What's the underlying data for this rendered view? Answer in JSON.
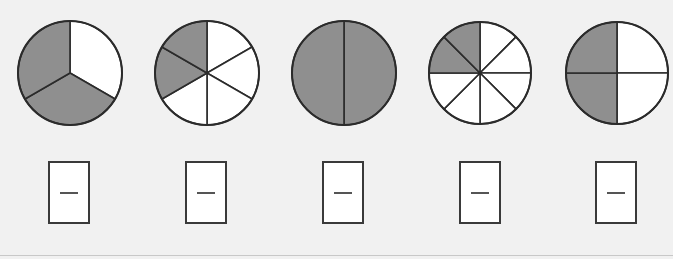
{
  "colors": {
    "shaded": "#8f8f8f",
    "unshaded": "#ffffff",
    "outline": "#2b2b2b",
    "background": "#f1f1f1"
  },
  "figures": [
    {
      "id": "circle-1",
      "parts": 3,
      "shaded": [
        1,
        2
      ],
      "start_angle": -90,
      "cx": 70,
      "cy": 73,
      "r": 52
    },
    {
      "id": "circle-2",
      "parts": 6,
      "shaded": [
        4,
        5
      ],
      "start_angle": -90,
      "cx": 207,
      "cy": 73,
      "r": 52
    },
    {
      "id": "circle-3",
      "parts": 2,
      "shaded": [
        0,
        1
      ],
      "start_angle": -90,
      "cx": 344,
      "cy": 73,
      "r": 52
    },
    {
      "id": "circle-4",
      "parts": 8,
      "shaded": [
        6,
        7
      ],
      "start_angle": -90,
      "cx": 480,
      "cy": 73,
      "r": 51
    },
    {
      "id": "circle-5",
      "parts": 4,
      "shaded": [
        2,
        3
      ],
      "start_angle": -90,
      "cx": 617,
      "cy": 73,
      "r": 51
    }
  ],
  "answer_boxes": [
    {
      "x": 48,
      "y": 161,
      "value": ""
    },
    {
      "x": 185,
      "y": 161,
      "value": ""
    },
    {
      "x": 322,
      "y": 161,
      "value": ""
    },
    {
      "x": 459,
      "y": 161,
      "value": ""
    },
    {
      "x": 595,
      "y": 161,
      "value": ""
    }
  ]
}
